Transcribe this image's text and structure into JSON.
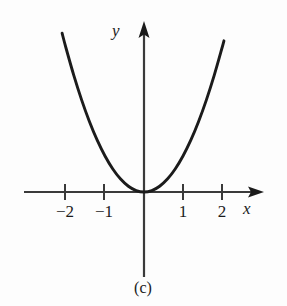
{
  "figure": {
    "caption": "(c)",
    "background_color": "#fdfdfd",
    "curve_color": "#1b1b1b",
    "axis_color": "#3a3a3a"
  },
  "axes": {
    "x_label": "x",
    "y_label": "y",
    "x_ticks": [
      {
        "value": -2,
        "label": "−2"
      },
      {
        "value": -1,
        "label": "−1"
      },
      {
        "value": 1,
        "label": "1"
      },
      {
        "value": 2,
        "label": "2"
      }
    ],
    "y_ticks": []
  },
  "chart_data": {
    "type": "line",
    "title": "(c)",
    "xlabel": "x",
    "ylabel": "y",
    "grid": false,
    "legend": null,
    "xlim": [
      -2.3,
      2.3
    ],
    "ylim": [
      -0.4,
      4.6
    ],
    "x_ticks": [
      -2,
      -1,
      1,
      2
    ],
    "x_tick_labels": [
      "−2",
      "−1",
      "1",
      "2"
    ],
    "y_ticks": [],
    "y_tick_labels": [],
    "series": [
      {
        "name": "y = x^2",
        "equation": "y = x^2",
        "color": "#1b1b1b",
        "x": [
          -2.1,
          -2.0,
          -1.8,
          -1.6,
          -1.4,
          -1.2,
          -1.0,
          -0.8,
          -0.6,
          -0.4,
          -0.2,
          0.0,
          0.2,
          0.4,
          0.6,
          0.8,
          1.0,
          1.2,
          1.4,
          1.6,
          1.8,
          2.0,
          2.05
        ],
        "values": [
          4.41,
          4.0,
          3.24,
          2.56,
          1.96,
          1.44,
          1.0,
          0.64,
          0.36,
          0.16,
          0.04,
          0.0,
          0.04,
          0.16,
          0.36,
          0.64,
          1.0,
          1.44,
          1.96,
          2.56,
          3.24,
          4.0,
          4.2
        ]
      }
    ],
    "annotations": [
      {
        "text": "vertex at origin (0, 0)"
      }
    ]
  }
}
